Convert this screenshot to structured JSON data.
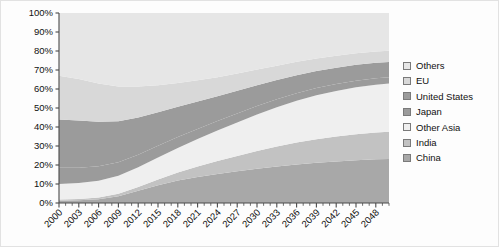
{
  "chart_data": {
    "type": "area",
    "title": "",
    "xlabel": "",
    "ylabel": "",
    "stacked": true,
    "normalized": true,
    "grid": false,
    "legend_position": "right",
    "ylim": [
      0,
      100
    ],
    "ytick_labels": [
      "0%",
      "10%",
      "20%",
      "30%",
      "40%",
      "50%",
      "60%",
      "70%",
      "80%",
      "90%",
      "100%"
    ],
    "ytick_values": [
      0,
      10,
      20,
      30,
      40,
      50,
      60,
      70,
      80,
      90,
      100
    ],
    "xlim": [
      2000,
      2050
    ],
    "xtick_labels": [
      "2000",
      "2003",
      "2006",
      "2009",
      "2012",
      "2015",
      "2018",
      "2021",
      "2024",
      "2027",
      "2030",
      "2033",
      "2036",
      "2039",
      "2042",
      "2045",
      "2048"
    ],
    "xtick_values": [
      2000,
      2003,
      2006,
      2009,
      2012,
      2015,
      2018,
      2021,
      2024,
      2027,
      2030,
      2033,
      2036,
      2039,
      2042,
      2045,
      2048
    ],
    "x": [
      2000,
      2003,
      2006,
      2009,
      2012,
      2015,
      2018,
      2021,
      2024,
      2027,
      2030,
      2033,
      2036,
      2039,
      2042,
      2045,
      2048,
      2050
    ],
    "stack_order_bottom_to_top": [
      "China",
      "India",
      "Other Asia",
      "Japan",
      "United States",
      "EU",
      "Others"
    ],
    "series": [
      {
        "name": "China",
        "color": "#a8a8a8",
        "values": [
          1.2,
          1.4,
          2.0,
          3.6,
          6.4,
          9.4,
          11.8,
          13.7,
          15.3,
          16.7,
          18.0,
          19.2,
          20.3,
          21.2,
          21.9,
          22.5,
          23.0,
          23.2
        ]
      },
      {
        "name": "India",
        "color": "#c2c2c2",
        "values": [
          0.6,
          0.7,
          0.9,
          1.3,
          2.0,
          3.0,
          4.2,
          5.5,
          6.8,
          8.1,
          9.4,
          10.5,
          11.5,
          12.4,
          13.1,
          13.7,
          14.1,
          14.3
        ]
      },
      {
        "name": "Other Asia",
        "color": "#efefef",
        "values": [
          8.2,
          8.4,
          8.8,
          9.4,
          10.4,
          11.6,
          13.0,
          14.5,
          16.0,
          17.6,
          19.2,
          20.7,
          22.0,
          23.1,
          24.0,
          24.7,
          25.2,
          25.4
        ]
      },
      {
        "name": "Japan",
        "color": "#9b9b9b",
        "values": [
          8.5,
          8.1,
          7.6,
          7.1,
          6.6,
          6.1,
          5.7,
          5.3,
          5.0,
          4.7,
          4.4,
          4.2,
          4.0,
          3.8,
          3.6,
          3.5,
          3.4,
          3.3
        ]
      },
      {
        "name": "United States",
        "color": "#9b9b9b",
        "values": [
          25.5,
          24.8,
          23.4,
          21.6,
          19.6,
          17.6,
          15.9,
          14.4,
          13.1,
          12.0,
          11.0,
          10.2,
          9.5,
          9.0,
          8.6,
          8.3,
          8.1,
          8.0
        ]
      },
      {
        "name": "EU",
        "color": "#d8d8d8",
        "values": [
          23.0,
          21.8,
          20.2,
          18.3,
          16.3,
          14.3,
          12.6,
          11.2,
          10.0,
          9.0,
          8.2,
          7.5,
          7.0,
          6.6,
          6.3,
          6.1,
          6.0,
          5.9
        ]
      },
      {
        "name": "Others",
        "color": "#e6e6e6",
        "values": [
          33.0,
          34.8,
          37.1,
          38.7,
          38.7,
          38.0,
          36.8,
          35.4,
          33.8,
          31.9,
          29.8,
          27.7,
          25.7,
          23.9,
          22.5,
          21.2,
          20.2,
          19.9
        ]
      }
    ]
  },
  "legend": {
    "items": [
      {
        "label": "Others",
        "color": "#e6e6e6"
      },
      {
        "label": "EU",
        "color": "#d8d8d8"
      },
      {
        "label": "United States",
        "color": "#9b9b9b"
      },
      {
        "label": "Japan",
        "color": "#9b9b9b"
      },
      {
        "label": "Other Asia",
        "color": "#efefef"
      },
      {
        "label": "India",
        "color": "#c2c2c2"
      },
      {
        "label": "China",
        "color": "#a8a8a8"
      }
    ]
  },
  "plot_geometry": {
    "left": 58,
    "right": 388,
    "top": 12,
    "bottom": 202
  }
}
